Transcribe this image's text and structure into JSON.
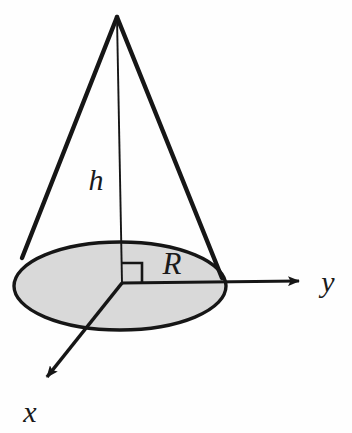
{
  "figure": {
    "background_color": "#fefefe",
    "stroke_color": "#161616",
    "base_fill_color": "#d9d9d9",
    "labels": {
      "height": "h",
      "radius": "R",
      "axis_x": "x",
      "axis_y": "y"
    },
    "geometry": {
      "apex": [
        117,
        17
      ],
      "origin": [
        122,
        283
      ],
      "base_ellipse": {
        "cx": 120,
        "cy": 286,
        "rx": 106,
        "ry": 44
      },
      "slant_left_end": [
        22,
        258
      ],
      "slant_right_end": [
        222,
        278
      ],
      "axis_y_tip": [
        305,
        281
      ],
      "axis_x_tip": [
        40,
        385
      ],
      "right_angle_square": [
        122,
        263,
        20,
        20
      ]
    },
    "label_positions": {
      "height": [
        96,
        190
      ],
      "radius": [
        162,
        274
      ],
      "axis_x": [
        20,
        422
      ],
      "axis_y": [
        320,
        292
      ]
    }
  }
}
